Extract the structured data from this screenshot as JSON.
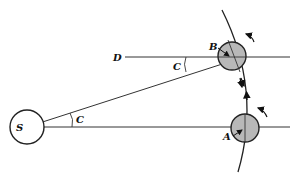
{
  "diagram": {
    "labels": {
      "sun": "S",
      "point_a": "A",
      "point_b": "B",
      "point_d": "D",
      "angle_c_at_sun": "C",
      "angle_c_at_d": "C"
    },
    "colors": {
      "line": "#222222",
      "planet_fill": "#b8b8b8",
      "sun_fill": "#ffffff"
    }
  }
}
